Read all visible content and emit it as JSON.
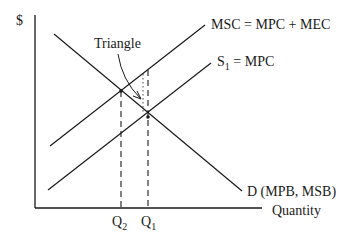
{
  "diagram": {
    "y_axis_label": "$",
    "x_axis_label": "Quantity",
    "curves": {
      "msc": "MSC = MPC + MEC",
      "s1_main": "S",
      "s1_sub": "1",
      "s1_rest": " = MPC",
      "demand": "D  (MPB, MSB)"
    },
    "annotation": "Triangle",
    "ticks": {
      "q2_main": "Q",
      "q2_sub": "2",
      "q1_main": "Q",
      "q1_sub": "1"
    },
    "colors": {
      "line": "#1a1a1a",
      "background": "#ffffff"
    }
  }
}
